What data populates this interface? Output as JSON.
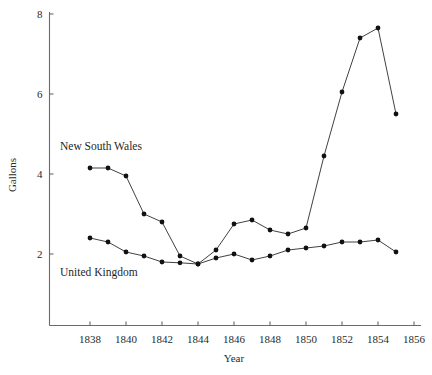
{
  "chart_data": {
    "type": "line",
    "title": "",
    "xlabel": "Year",
    "ylabel": "Gallons",
    "xlim": [
      1836,
      1856
    ],
    "ylim": [
      0,
      8
    ],
    "xticks": [
      1838,
      1840,
      1842,
      1844,
      1846,
      1848,
      1850,
      1852,
      1854,
      1856
    ],
    "xticklabels": [
      "1838",
      "1840",
      "1842",
      "1844",
      "1846",
      "1848",
      "1850",
      "1852",
      "1854",
      "1856"
    ],
    "yticks": [
      2,
      4,
      6,
      8
    ],
    "yticklabels": [
      "2",
      "4",
      "6",
      "8"
    ],
    "grid": false,
    "legend_position": "inline-annotation",
    "x": [
      1838,
      1839,
      1840,
      1841,
      1842,
      1843,
      1844,
      1845,
      1846,
      1847,
      1848,
      1849,
      1850,
      1851,
      1852,
      1853,
      1854,
      1855
    ],
    "series": [
      {
        "name": "New South Wales",
        "marker": "filled-circle",
        "values": [
          4.15,
          4.15,
          3.95,
          3.0,
          2.8,
          1.95,
          1.75,
          2.1,
          2.75,
          2.85,
          2.6,
          2.5,
          2.65,
          4.45,
          6.05,
          7.4,
          7.65,
          5.5
        ]
      },
      {
        "name": "United Kingdom",
        "marker": "filled-circle",
        "values": [
          2.4,
          2.3,
          2.05,
          1.95,
          1.8,
          1.78,
          1.75,
          1.9,
          2.0,
          1.85,
          1.95,
          2.1,
          2.15,
          2.2,
          2.3,
          2.3,
          2.35,
          2.05
        ]
      }
    ],
    "annotations": [
      {
        "text": "New South Wales",
        "x": 1838.0,
        "y": 4.6
      },
      {
        "text": "United Kingdom",
        "x": 1838.0,
        "y": 1.45
      }
    ]
  }
}
